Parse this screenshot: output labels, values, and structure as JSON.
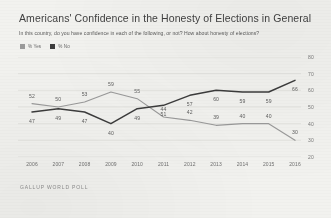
{
  "title": "Americans' Confidence in the Honesty of Elections in General",
  "subtitle": "In this country, do you have confidence in each of the following, or not? How about honesty of elections?",
  "source": "GALLUP WORLD POLL",
  "legend": [
    {
      "label": "% Yes",
      "color": "#9a9a9a"
    },
    {
      "label": "% No",
      "color": "#3c3c3c"
    }
  ],
  "chart_data": {
    "type": "line",
    "title": "Americans' Confidence in the Honesty of Elections in General",
    "subtitle": "In this country, do you have confidence in each of the following, or not? How about honesty of elections?",
    "xlabel": "",
    "ylabel": "",
    "categories": [
      "2006",
      "2007",
      "2008",
      "2009",
      "2010",
      "2011",
      "2012",
      "2013",
      "2014",
      "2015",
      "2016"
    ],
    "ylim": [
      20,
      80
    ],
    "yticks": [
      20,
      30,
      40,
      50,
      60,
      70,
      80
    ],
    "grid": true,
    "legend_position": "top-left",
    "series": [
      {
        "name": "% Yes",
        "color": "#9a9a9a",
        "values": [
          52,
          50,
          53,
          59,
          55,
          44,
          42,
          39,
          40,
          40,
          30
        ]
      },
      {
        "name": "% No",
        "color": "#3c3c3c",
        "values": [
          47,
          49,
          47,
          40,
          49,
          51,
          57,
          60,
          59,
          59,
          66
        ]
      }
    ]
  }
}
